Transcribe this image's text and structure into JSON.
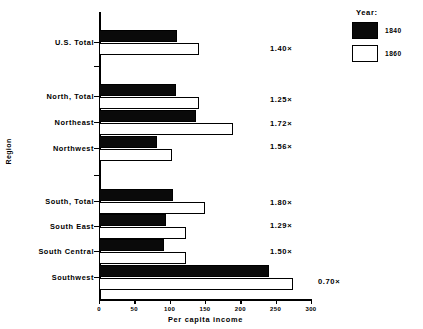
{
  "chart_data": {
    "type": "bar",
    "orientation": "horizontal",
    "title": "",
    "xlabel": "Per capita income",
    "ylabel": "Region",
    "xlim": [
      0,
      300
    ],
    "xticks": [
      0,
      50,
      100,
      150,
      200,
      250,
      300
    ],
    "grid": false,
    "legend": {
      "title": "Year:",
      "position": "top-right",
      "entries": [
        {
          "name": "1840",
          "color": "#0a0a0a"
        },
        {
          "name": "1860",
          "color": "#ffffff"
        }
      ]
    },
    "categories": [
      "U.S. Total",
      "North, Total",
      "Northeast",
      "Northwest",
      "South, Total",
      "South East",
      "South Central",
      "Southwest"
    ],
    "series": [
      {
        "name": "1840",
        "values": [
          110,
          109,
          137,
          82,
          105,
          95,
          92,
          240
        ]
      },
      {
        "name": "1860",
        "values": [
          142,
          141,
          190,
          103,
          150,
          123,
          123,
          275
        ]
      }
    ],
    "annotations": {
      "label": "growth ratio",
      "values": [
        "1.40×",
        "1.25×",
        "1.72×",
        "1.56×",
        "1.80×",
        "1.29×",
        "1.50×",
        "0.70×"
      ]
    }
  },
  "layout": {
    "rows": [
      {
        "label": "U.S. Total",
        "y_dark": 30,
        "y_light": 43,
        "ratio_y": 44,
        "ratio_x": 270,
        "tick_y": 42
      },
      {
        "label": "North, Total",
        "y_dark": 84,
        "y_light": 97,
        "ratio_y": 95,
        "ratio_x": 270,
        "tick_y": 96
      },
      {
        "label": "Northeast",
        "y_dark": 110,
        "y_light": 123,
        "ratio_y": 119,
        "ratio_x": 270,
        "tick_y": 122
      },
      {
        "label": "Northwest",
        "y_dark": 136,
        "y_light": 149,
        "ratio_y": 142,
        "ratio_x": 270,
        "tick_y": 148
      },
      {
        "label": "South, Total",
        "y_dark": 189,
        "y_light": 202,
        "ratio_y": 198,
        "ratio_x": 270,
        "tick_y": 201
      },
      {
        "label": "South East",
        "y_dark": 214,
        "y_light": 227,
        "ratio_y": 221,
        "ratio_x": 270,
        "tick_y": 226
      },
      {
        "label": "South Central",
        "y_dark": 239,
        "y_light": 252,
        "ratio_y": 247,
        "ratio_x": 270,
        "tick_y": 251
      },
      {
        "label": "Southwest",
        "y_dark": 265,
        "y_light": 278,
        "ratio_y": 277,
        "ratio_x": 318,
        "tick_y": 277
      }
    ],
    "extra_y_ticks": [
      66,
      175
    ],
    "bar_height": 12
  }
}
